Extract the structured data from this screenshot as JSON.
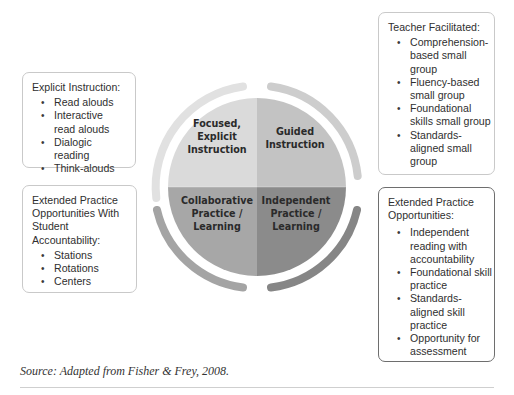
{
  "diagram": {
    "quadrants": [
      {
        "id": "top-left",
        "label_lines": [
          "Focused,",
          "Explicit",
          "Instruction"
        ],
        "color": "#d9d9d9"
      },
      {
        "id": "top-right",
        "label_lines": [
          "Guided",
          "Instruction"
        ],
        "color": "#c2c2c2"
      },
      {
        "id": "bottom-left",
        "label_lines": [
          "Collaborative",
          "Practice /",
          "Learning"
        ],
        "color": "#a6a6a6"
      },
      {
        "id": "bottom-right",
        "label_lines": [
          "Independent",
          "Practice /",
          "Learning"
        ],
        "color": "#8a8a8a"
      }
    ],
    "arcs": [
      {
        "position": "top-left",
        "color": "#e0e0e0"
      },
      {
        "position": "top-right",
        "color": "#cdcdcd"
      },
      {
        "position": "bottom-left",
        "color": "#a3a3a3"
      },
      {
        "position": "bottom-right",
        "color": "#858585"
      }
    ]
  },
  "boxes": {
    "left_top": {
      "title": "Explicit Instruction:",
      "items": [
        "Read alouds",
        "Interactive read alouds",
        "Dialogic reading",
        "Think-alouds"
      ]
    },
    "left_bottom": {
      "title": "Extended Practice Opportunities With Student Accountability:",
      "items": [
        "Stations",
        "Rotations",
        "Centers"
      ]
    },
    "right_top": {
      "title": "Teacher Facilitated:",
      "items": [
        "Comprehension-based small group",
        "Fluency-based small group",
        "Foundational skills small group",
        "Standards-aligned small group"
      ]
    },
    "right_bottom": {
      "title": "Extended Practice Opportunities:",
      "items": [
        "Independent reading with accountability",
        "Foundational skill practice",
        "Standards-aligned skill practice",
        "Opportunity for assessment"
      ]
    }
  },
  "caption": {
    "source": "Source: Adapted from Fisher & Frey, 2008."
  }
}
